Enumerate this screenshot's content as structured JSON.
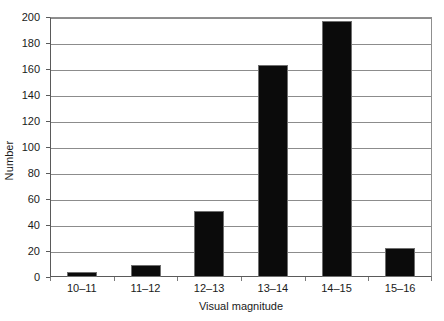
{
  "chart_data": {
    "type": "bar",
    "title": "",
    "subtitle": "",
    "categories": [
      "10–11",
      "11–12",
      "12–13",
      "13–14",
      "14–15",
      "15–16"
    ],
    "values": [
      4,
      9,
      51,
      163,
      197,
      22
    ],
    "xlabel": "Visual magnitude",
    "ylabel": "Number",
    "ylim": [
      0,
      200
    ],
    "ytick_step": 20,
    "ytick_labels": [
      "0",
      "20",
      "40",
      "60",
      "80",
      "100",
      "120",
      "140",
      "160",
      "180",
      "200"
    ],
    "grid": true,
    "grid_axis": "y",
    "legend": false,
    "legend_position": "none",
    "bar_color": "#0b0b0b",
    "bar_edge_color": "#6f6f6f",
    "grid_color": "#8c8c8c",
    "axis_color": "#5a5a5a",
    "background_color": "#ffffff",
    "text_color": "#1a1a1a",
    "annotations": []
  }
}
